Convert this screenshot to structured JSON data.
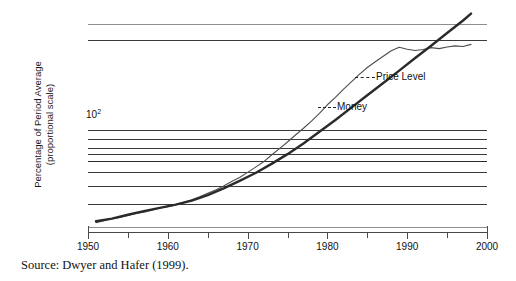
{
  "figure": {
    "source_note": "Source: Dwyer and Hafer (1999)."
  },
  "chart_data": {
    "type": "line",
    "title": "",
    "xlabel": "",
    "ylabel": "Percentage of Period Average",
    "ylabel_line2": "(proportional scale)",
    "y_scale": "log",
    "grid": true,
    "legend_position": "inline-annotations",
    "xlim": [
      1950,
      2000
    ],
    "x_ticks": [
      1950,
      1955,
      1960,
      1965,
      1970,
      1975,
      1980,
      1985,
      1990,
      1995,
      2000
    ],
    "x_tick_labels": [
      "1950",
      "",
      "1960",
      "",
      "1970",
      "",
      "1980",
      "",
      "1990",
      "",
      "2000"
    ],
    "x_major_labels": [
      "1950",
      "1960",
      "1970",
      "1980",
      "1990",
      "2000"
    ],
    "y_tick_labels": [
      "10²"
    ],
    "y_tick_values": [
      100
    ],
    "y_gridline_values": [
      400,
      100,
      90,
      80,
      70,
      60,
      50,
      40,
      30,
      20
    ],
    "annotations": [
      {
        "text": "Price Level",
        "x": 1993,
        "y": 330
      },
      {
        "text": "Money",
        "x": 1982,
        "y": 165
      }
    ],
    "series": [
      {
        "name": "Money",
        "style": "thick-dark",
        "color": "#2a2a2a",
        "x": [
          1951,
          1953,
          1955,
          1957,
          1959,
          1961,
          1963,
          1965,
          1967,
          1969,
          1971,
          1973,
          1975,
          1977,
          1979,
          1981,
          1983,
          1985,
          1987,
          1989,
          1991,
          1993,
          1995,
          1997,
          1998
        ],
        "y": [
          22,
          23,
          24.5,
          26,
          27.5,
          29,
          31,
          34,
          38,
          43,
          49,
          57,
          67,
          80,
          97,
          118,
          145,
          178,
          218,
          268,
          330,
          405,
          500,
          615,
          690
        ]
      },
      {
        "name": "Price Level",
        "style": "thin-wiggly",
        "color": "#4d4d4d",
        "x": [
          1951,
          1952,
          1953,
          1954,
          1955,
          1956,
          1957,
          1958,
          1959,
          1960,
          1961,
          1962,
          1963,
          1964,
          1965,
          1966,
          1967,
          1968,
          1969,
          1970,
          1971,
          1972,
          1973,
          1974,
          1975,
          1976,
          1977,
          1978,
          1979,
          1980,
          1981,
          1982,
          1983,
          1984,
          1985,
          1986,
          1987,
          1988,
          1989,
          1990,
          1991,
          1992,
          1993,
          1994,
          1995,
          1996,
          1997,
          1998
        ],
        "y": [
          21.5,
          22.2,
          23.0,
          23.4,
          24.2,
          25.0,
          25.6,
          26.4,
          27.4,
          28.0,
          29.0,
          30.2,
          31.4,
          33.0,
          35.0,
          37.0,
          39.5,
          42.5,
          45.5,
          49.5,
          54.0,
          59.0,
          66.0,
          73.5,
          82.0,
          92.0,
          103.0,
          116.0,
          132.0,
          152.0,
          172.0,
          196.0,
          222.0,
          252.0,
          282.0,
          310.0,
          340.0,
          372.0,
          395.0,
          382.0,
          374.0,
          380.0,
          392.0,
          386.0,
          396.0,
          404.0,
          400.0,
          414.0
        ]
      }
    ]
  }
}
